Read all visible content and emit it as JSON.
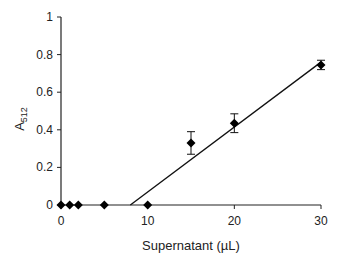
{
  "chart_data": {
    "type": "scatter",
    "title": "",
    "xlabel": "Supernatant (µL)",
    "ylabel": "A",
    "ylabel_subscript": "512",
    "xlim": [
      0,
      30
    ],
    "ylim": [
      0,
      1
    ],
    "xticks": [
      0,
      10,
      20,
      30
    ],
    "yticks": [
      0,
      0.2,
      0.4,
      0.6,
      0.8,
      1
    ],
    "ytick_labels": [
      "0",
      "0.2",
      "0.4",
      "0.6",
      "0.8",
      "1"
    ],
    "xtick_labels": [
      "0",
      "10",
      "20",
      "30"
    ],
    "grid": false,
    "legend": null,
    "series": [
      {
        "name": "data",
        "marker": "diamond",
        "x": [
          0,
          1,
          2,
          5,
          10,
          15,
          20,
          30
        ],
        "y": [
          0,
          0,
          0,
          0,
          0,
          0.33,
          0.435,
          0.745
        ],
        "error": [
          0,
          0,
          0,
          0,
          0,
          0.06,
          0.05,
          0.025
        ]
      }
    ],
    "fit_line": {
      "x": [
        8,
        30
      ],
      "y": [
        0,
        0.76
      ]
    }
  }
}
